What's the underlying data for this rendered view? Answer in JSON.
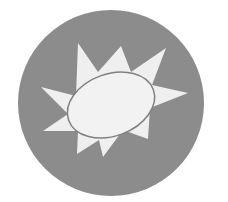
{
  "icon": {
    "name": "sun-burst-badge",
    "colors": {
      "background": "#ffffff",
      "disc": "#8c8c8c",
      "burst": "#efefef",
      "outline": "#808080"
    },
    "disc": {
      "cx": 111,
      "cy": 103,
      "r": 93
    },
    "burst_points": "78,43 98,72 121,46 131,72 166,48 152,85 188,93 150,108 148,139 123,130 103,157 99,140 77,154 78,131 43,131 68,114 41,87 76,96",
    "ellipse": {
      "cx": 111,
      "cy": 105,
      "rx": 45,
      "ry": 31,
      "rotate": -20
    }
  }
}
